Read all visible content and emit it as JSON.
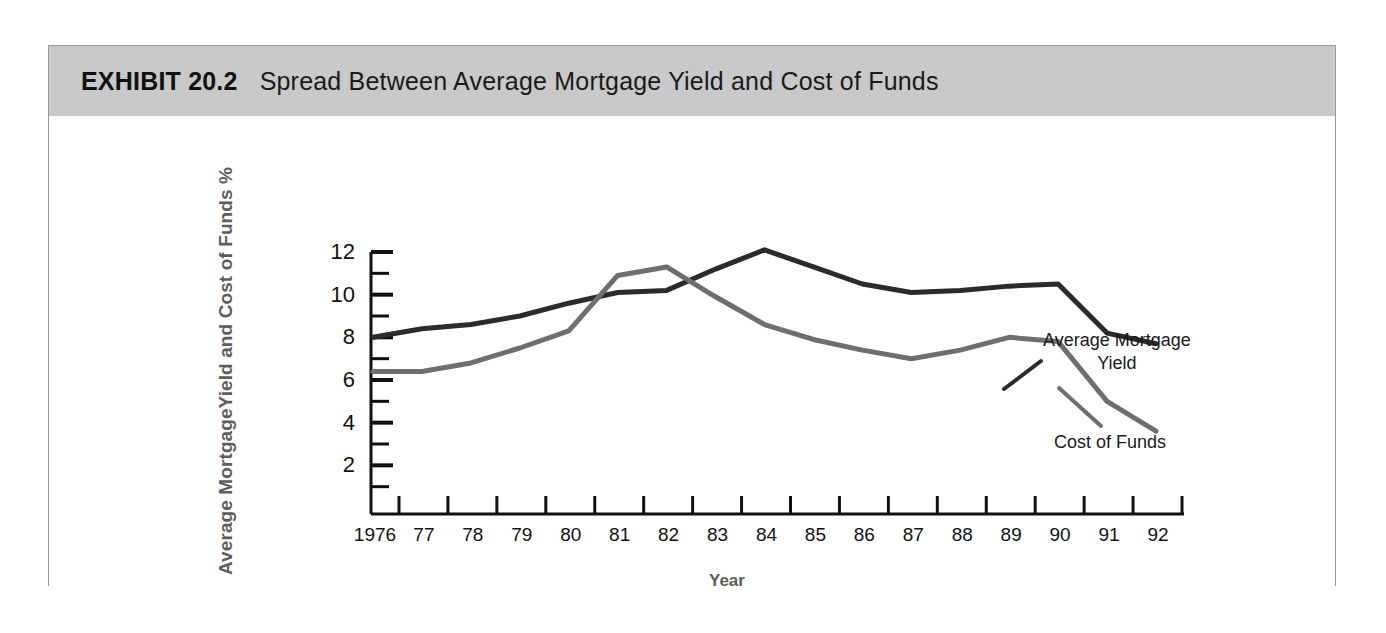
{
  "exhibit": {
    "number": "EXHIBIT 20.2",
    "title": "Spread Between Average Mortgage Yield and Cost of Funds"
  },
  "chart_data": {
    "type": "line",
    "title": "Spread Between Average Mortgage Yield and Cost of Funds",
    "xlabel": "Year",
    "ylabel": "Average MortgageYield and Cost of Funds %",
    "x": [
      1976,
      1977,
      1978,
      1979,
      1980,
      1981,
      1982,
      1983,
      1984,
      1985,
      1986,
      1987,
      1988,
      1989,
      1990,
      1991,
      1992
    ],
    "categories": [
      "1976",
      "77",
      "78",
      "79",
      "80",
      "81",
      "82",
      "83",
      "84",
      "85",
      "86",
      "87",
      "88",
      "89",
      "90",
      "91",
      "92"
    ],
    "xlim": [
      1976,
      1992
    ],
    "ylim": [
      0,
      12
    ],
    "yticks": [
      2,
      4,
      6,
      8,
      10,
      12
    ],
    "ytick_labels": [
      "2",
      "4",
      "6",
      "8",
      "10",
      "12"
    ],
    "minor_yticks": [
      1,
      3,
      5,
      7,
      9,
      11
    ],
    "grid": false,
    "legend_position": "inline-annotation",
    "series": [
      {
        "name": "Average Mortgage Yield",
        "color": "#2b2b2b",
        "values": [
          8.0,
          8.4,
          8.6,
          9.0,
          9.6,
          10.1,
          10.2,
          11.2,
          12.1,
          11.3,
          10.5,
          10.1,
          10.2,
          10.4,
          10.5,
          8.2,
          7.7
        ]
      },
      {
        "name": "Cost of Funds",
        "color": "#6e6e6e",
        "values": [
          6.4,
          6.4,
          6.8,
          7.5,
          8.3,
          10.9,
          11.3,
          9.9,
          8.6,
          7.9,
          7.4,
          7.0,
          7.4,
          8.0,
          7.8,
          5.0,
          3.6
        ]
      }
    ],
    "annotations": [
      {
        "text_line1": "Average Mortgage",
        "text_line2": "Yield",
        "series": "Average Mortgage Yield"
      },
      {
        "text_line1": "Cost of Funds",
        "text_line2": "",
        "series": "Cost of Funds"
      }
    ]
  },
  "colors": {
    "header_band": "#c9c9c9",
    "frame_border": "#9a9a9a",
    "axis": "#111111",
    "mortgage_yield_line": "#2b2b2b",
    "cost_of_funds_line": "#6e6e6e",
    "axis_title": "#5d5d5d"
  }
}
